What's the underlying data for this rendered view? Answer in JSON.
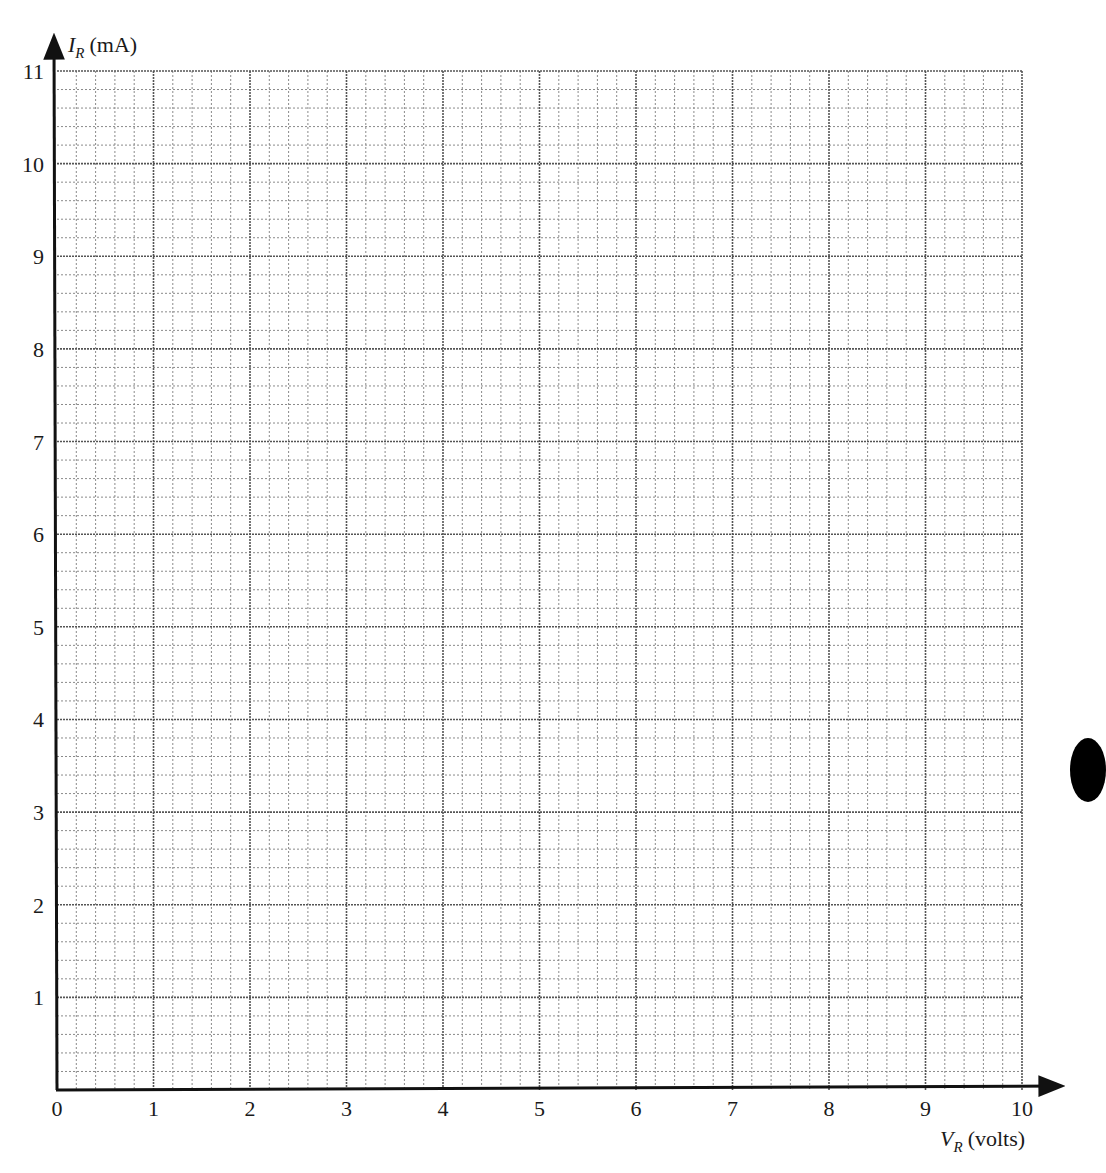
{
  "chart_data": {
    "type": "scatter",
    "title": "",
    "xlabel": {
      "symbol": "V",
      "subscript": "R",
      "unit": "(volts)"
    },
    "ylabel": {
      "symbol": "I",
      "subscript": "R",
      "unit": "(mA)"
    },
    "xlim": [
      0,
      10
    ],
    "ylim": [
      0,
      11
    ],
    "x_ticks": [
      "0",
      "1",
      "2",
      "3",
      "4",
      "5",
      "6",
      "7",
      "8",
      "9",
      "10"
    ],
    "y_ticks": [
      "1",
      "2",
      "3",
      "4",
      "5",
      "6",
      "7",
      "8",
      "9",
      "10",
      "11"
    ],
    "minor_divisions_per_unit": 5,
    "grid": true,
    "series": [],
    "legend": null
  },
  "colors": {
    "axis": "#111111",
    "major_grid": "#555555",
    "minor_grid": "#8a8a8a",
    "edge_mark": "#000000"
  }
}
